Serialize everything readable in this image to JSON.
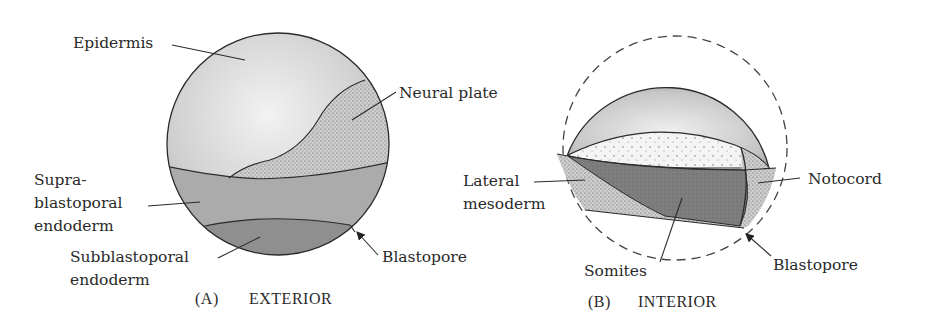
{
  "figure": {
    "panel_a": {
      "caption_letter": "(A)",
      "caption_title": "EXTERIOR",
      "labels": {
        "epidermis": "Epidermis",
        "neural_plate": "Neural plate",
        "supra_1": "Supra-",
        "supra_2": "blastoporal",
        "supra_3": "endoderm",
        "sub_1": "Subblastoporal",
        "sub_2": "endoderm",
        "blastopore": "Blastopore"
      }
    },
    "panel_b": {
      "caption_letter": "(B)",
      "caption_title": "INTERIOR",
      "labels": {
        "lateral_1": "Lateral",
        "lateral_2": "mesoderm",
        "notocord": "Notocord",
        "somites": "Somites",
        "blastopore": "Blastopore"
      }
    },
    "colors": {
      "epidermis": "#d6d6d6",
      "supra_endoderm": "#a9a9a9",
      "sub_endoderm": "#8e8e8e",
      "neural_plate": "#c9c9c9",
      "somites": "#7a7a7a",
      "line": "#2b2b2b"
    }
  }
}
